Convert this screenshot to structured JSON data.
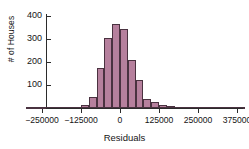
{
  "chart_data": {
    "type": "bar",
    "title": "",
    "subtitle": "",
    "xlabel": "Residuals",
    "ylabel": "# of Houses",
    "grid": false,
    "legend": null,
    "xlim": [
      -312500,
      412500
    ],
    "ylim": [
      0,
      430
    ],
    "xticks": [
      -250000,
      -125000,
      0,
      125000,
      250000,
      375000
    ],
    "xtick_labels": [
      "-250000",
      "-125000",
      "0",
      "125000",
      "250000",
      "375000"
    ],
    "yticks": [
      100,
      200,
      300,
      400
    ],
    "ytick_labels": [
      "100",
      "200",
      "300",
      "400"
    ],
    "bin_width": 25000,
    "bar_color": "#b6809d",
    "bar_edge_color": "#4a3240",
    "axis_color": "#2b2b2b",
    "bin_starts": [
      -300000,
      -275000,
      -250000,
      -225000,
      -200000,
      -175000,
      -150000,
      -125000,
      -100000,
      -75000,
      -50000,
      -25000,
      0,
      25000,
      50000,
      75000,
      100000,
      125000,
      150000,
      175000,
      200000,
      225000,
      250000,
      275000,
      300000,
      325000,
      350000,
      375000
    ],
    "values": [
      1,
      1,
      2,
      2,
      3,
      3,
      4,
      14,
      49,
      175,
      305,
      365,
      345,
      210,
      122,
      40,
      28,
      14,
      8,
      5,
      3,
      2,
      3,
      1,
      1,
      2,
      1,
      1
    ],
    "categories": [
      "-300000",
      "-275000",
      "-250000",
      "-225000",
      "-200000",
      "-175000",
      "-150000",
      "-125000",
      "-100000",
      "-75000",
      "-50000",
      "-25000",
      "0",
      "25000",
      "50000",
      "75000",
      "100000",
      "125000",
      "150000",
      "175000",
      "200000",
      "225000",
      "250000",
      "275000",
      "300000",
      "325000",
      "350000",
      "375000"
    ]
  },
  "axes": {
    "y_axis_label": "# of Houses",
    "x_axis_label": "Residuals"
  }
}
